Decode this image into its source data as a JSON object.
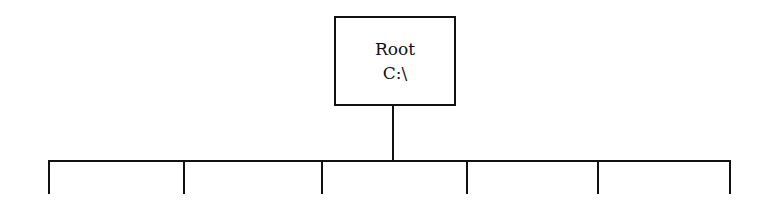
{
  "diagram": {
    "type": "tree",
    "root": {
      "title": "Root",
      "path": "C:\\"
    },
    "children_count": 6,
    "children": [
      {
        "label": ""
      },
      {
        "label": ""
      },
      {
        "label": ""
      },
      {
        "label": ""
      },
      {
        "label": ""
      },
      {
        "label": ""
      }
    ],
    "colors": {
      "line": "#111111",
      "background": "#ffffff"
    }
  }
}
